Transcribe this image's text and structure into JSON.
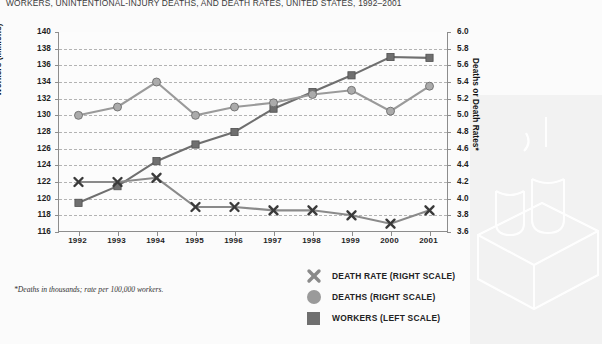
{
  "chart_data": {
    "type": "line",
    "title": "WORKERS, UNINTENTIONAL-INJURY DEATHS, AND DEATH RATES, UNITED STATES, 1992–2001",
    "xlabel": "",
    "ylabel": "Workers (Millions)",
    "y2label": "Deaths or Death Rates*",
    "ylim": [
      116,
      140
    ],
    "y2lim": [
      3.6,
      6.0
    ],
    "ytick_step": 2,
    "y2tick_step": 0.2,
    "grid": true,
    "legend_position": "bottom-center",
    "footnote": "*Deaths in thousands; rate per 100,000 workers.",
    "categories": [
      "1992",
      "1993",
      "1994",
      "1995",
      "1996",
      "1997",
      "1998",
      "1999",
      "2000",
      "2001"
    ],
    "yticks": [
      "140",
      "138",
      "136",
      "134",
      "132",
      "130",
      "128",
      "126",
      "124",
      "122",
      "120",
      "118",
      "116"
    ],
    "y2ticks": [
      "6.0",
      "5.8",
      "5.6",
      "5.4",
      "5.2",
      "5.0",
      "4.8",
      "4.6",
      "4.4",
      "4.2",
      "4.0",
      "3.8",
      "3.6"
    ],
    "series": [
      {
        "name": "WORKERS (LEFT SCALE)",
        "axis": "left",
        "marker": "square",
        "color": "#6f6f6f",
        "values": [
          119.5,
          121.5,
          124.5,
          126.5,
          128.0,
          130.8,
          132.8,
          134.8,
          137.0,
          136.9
        ]
      },
      {
        "name": "DEATHS (RIGHT SCALE)",
        "axis": "right",
        "marker": "circle",
        "color": "#9a9a9a",
        "values": [
          5.0,
          5.1,
          5.4,
          5.0,
          5.1,
          5.15,
          5.25,
          5.3,
          5.05,
          5.35
        ]
      },
      {
        "name": "DEATH RATE (RIGHT SCALE)",
        "axis": "right",
        "marker": "x",
        "color": "#8a8a8a",
        "values": [
          4.2,
          4.2,
          4.25,
          3.9,
          3.9,
          3.86,
          3.86,
          3.8,
          3.7,
          3.86
        ]
      }
    ]
  },
  "legend": {
    "items": [
      {
        "label": "DEATH RATE (RIGHT SCALE)",
        "marker": "x"
      },
      {
        "label": "DEATHS (RIGHT SCALE)",
        "marker": "circle"
      },
      {
        "label": "WORKERS (LEFT SCALE)",
        "marker": "square"
      }
    ]
  },
  "colors": {
    "workers": "#6f6f6f",
    "deaths": "#9a9a9a",
    "death_rate": "#8a8a8a",
    "grid": "#b3b3b3",
    "axis": "#8d8d8d",
    "background": "#fbfbfb"
  }
}
